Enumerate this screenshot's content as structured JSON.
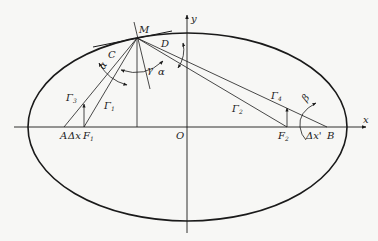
{
  "diagram": {
    "type": "ellipse-optics",
    "colors": {
      "stroke": "#1a1a1a",
      "background": "#f7f7f5"
    },
    "axes": {
      "x_label": "x",
      "y_label": "y",
      "origin_label": "O"
    },
    "points": {
      "M": "M",
      "C": "C",
      "D": "D",
      "A": "A",
      "B": "B",
      "F1": "F",
      "F1_sub": "1",
      "F2": "F",
      "F2_sub": "2"
    },
    "increments": {
      "dx": "Δx",
      "dx_prime": "Δx'"
    },
    "rays": {
      "g1": "Γ",
      "g1_sub": "1",
      "g2": "Γ",
      "g2_sub": "2",
      "g3": "Γ",
      "g3_sub": "3",
      "g4": "Γ",
      "g4_sub": "4"
    },
    "angles": {
      "alpha_left": "α",
      "alpha_right": "α",
      "gamma": "γ",
      "beta": "β"
    }
  }
}
